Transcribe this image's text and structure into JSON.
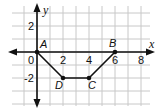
{
  "chart_data": {
    "type": "scatter",
    "title": "",
    "xlabel": "x",
    "ylabel": "y",
    "xlim": [
      -2,
      9
    ],
    "ylim": [
      -4,
      3.5
    ],
    "grid": true,
    "x_ticks": [
      "0",
      "2",
      "4",
      "6",
      "8"
    ],
    "y_ticks": [
      "2",
      "-2"
    ],
    "points": [
      {
        "label": "A",
        "x": 0,
        "y": 0
      },
      {
        "label": "B",
        "x": 6,
        "y": 0
      },
      {
        "label": "C",
        "x": 4,
        "y": -2
      },
      {
        "label": "D",
        "x": 2,
        "y": -2
      }
    ],
    "polyline": [
      "A",
      "D",
      "C",
      "B"
    ],
    "series": [
      {
        "name": "path",
        "x": [
          0,
          2,
          4,
          6
        ],
        "y": [
          0,
          -2,
          -2,
          0
        ]
      }
    ]
  },
  "colors": {
    "grid": "#c8c8c8",
    "axis": "#111111",
    "line": "#111111"
  }
}
